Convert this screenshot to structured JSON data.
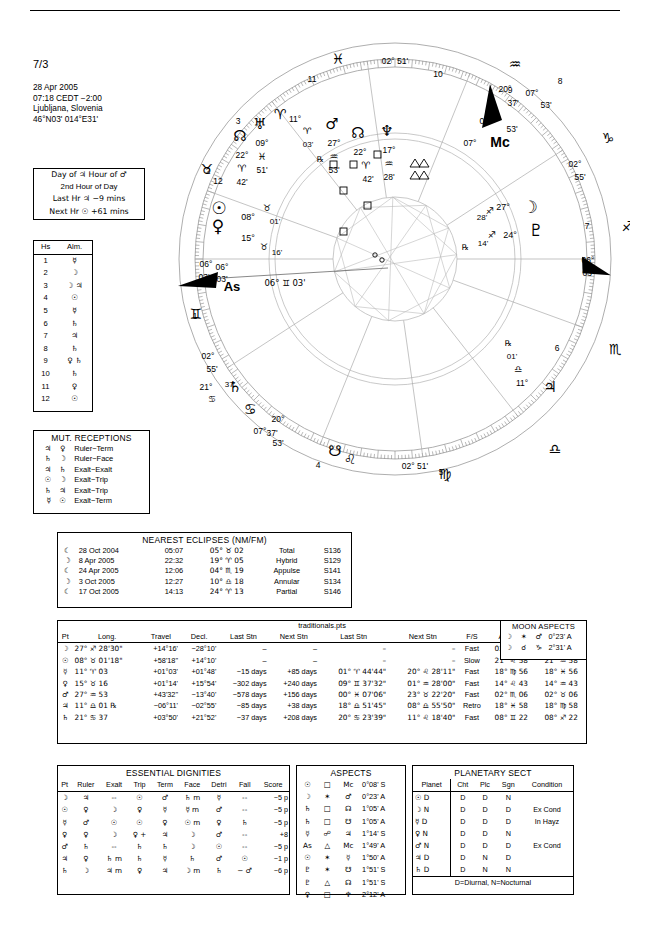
{
  "header": {
    "chart_number": "7/3",
    "date": "28 Apr 2005",
    "time": "07:18  CEDT −2:00",
    "place": "Ljubljana, Slovenia",
    "coords": "46°N03' 014°E31'"
  },
  "day_hour": {
    "line1": "Day of ♃  Hour of ♂",
    "line2": "2nd Hour of Day",
    "line3": "Last Hr ♃  −9 mins",
    "line4": "Next Hr ☉ +61 mins"
  },
  "almuten": {
    "col_house": "Hs",
    "col_alm": "Alm.",
    "rows": [
      {
        "house": "1",
        "alm": "☿"
      },
      {
        "house": "2",
        "alm": "☽"
      },
      {
        "house": "3",
        "alm": "☽ ♃"
      },
      {
        "house": "4",
        "alm": "☉"
      },
      {
        "house": "5",
        "alm": "☿"
      },
      {
        "house": "6",
        "alm": "♄"
      },
      {
        "house": "7",
        "alm": "♃"
      },
      {
        "house": "8",
        "alm": "♄"
      },
      {
        "house": "9",
        "alm": "♀ ♄"
      },
      {
        "house": "10",
        "alm": "♄"
      },
      {
        "house": "11",
        "alm": "♀"
      },
      {
        "house": "12",
        "alm": "☉"
      }
    ]
  },
  "mutual_receptions": {
    "title": "MUT. RECEPTIONS",
    "rows": [
      {
        "a": "♃",
        "b": "♀",
        "kind": "Ruler−Term"
      },
      {
        "a": "♄",
        "b": "☽",
        "kind": "Ruler−Face"
      },
      {
        "a": "♃",
        "b": "♄",
        "kind": "Exalt−Exalt"
      },
      {
        "a": "☉",
        "b": "☽",
        "kind": "Exalt−Trip"
      },
      {
        "a": "♄",
        "b": "♃",
        "kind": "Exalt−Trip"
      },
      {
        "a": "☿",
        "b": "☉",
        "kind": "Exalt−Term"
      }
    ]
  },
  "eclipses": {
    "title": "NEAREST ECLIPSES (NM/FM)",
    "rows": [
      {
        "phase": "☾",
        "date": "28 Oct 2004",
        "time": "05:07",
        "pos": "05° ♉ 02",
        "type": "Total",
        "saros": "S136"
      },
      {
        "phase": "☽",
        "date": "8 Apr 2005",
        "time": "22:32",
        "pos": "19° ♈ 05",
        "type": "Hybrid",
        "saros": "S129"
      },
      {
        "phase": "☾",
        "date": "24 Apr 2005",
        "time": "12:06",
        "pos": "04° ♏ 19",
        "type": "Appulse",
        "saros": "S141"
      },
      {
        "phase": "☽",
        "date": "3 Oct 2005",
        "time": "12:27",
        "pos": "10° ♎ 18",
        "type": "Annular",
        "saros": "S134"
      },
      {
        "phase": "☾",
        "date": "17 Oct 2005",
        "time": "14:13",
        "pos": "24° ♈ 13",
        "type": "Partial",
        "saros": "S146"
      }
    ]
  },
  "main_table": {
    "file_label": "traditionals.pts",
    "columns": [
      "Pt",
      "Long.",
      "Travel",
      "Decl.",
      "Last Stn",
      "Next Stn",
      "Last Stn",
      "Next Stn",
      "F/S",
      "Antiscia",
      "C.Ant."
    ],
    "rows": [
      {
        "pt": "☽",
        "long": "27° ♐ 28'30\"",
        "travel": "+14°16'",
        "decl": "−28°10'",
        "last_stn_d": "–",
        "next_stn_d": "–",
        "last_stn_p": "–",
        "next_stn_p": "–",
        "fs": "Fast",
        "antiscia": "02° ♑ 31",
        "cant": "02° ♋ 31"
      },
      {
        "pt": "☉",
        "long": "08° ♉ 01'18\"",
        "travel": "+58'18\"",
        "decl": "+14°10'",
        "last_stn_d": "–",
        "next_stn_d": "–",
        "last_stn_p": "–",
        "next_stn_p": "–",
        "fs": "Slow",
        "antiscia": "21° ♌ 58",
        "cant": "21° ♒ 58"
      },
      {
        "pt": "☿",
        "long": "11° ♈ 03",
        "travel": "+01°03'",
        "decl": "+01°48'",
        "last_stn_d": "−15 days",
        "next_stn_d": "+85 days",
        "last_stn_p": "01° ♈ 44'44\"",
        "next_stn_p": "20° ♌ 28'11\"",
        "fs": "Fast",
        "antiscia": "18° ♍ 56",
        "cant": "18° ♓ 56"
      },
      {
        "pt": "♀",
        "long": "15° ♉ 16",
        "travel": "+01°14'",
        "decl": "+15°54'",
        "last_stn_d": "−302 days",
        "next_stn_d": "+240 days",
        "last_stn_p": "09° ♊ 37'32\"",
        "next_stn_p": "01° ♒ 28'00\"",
        "fs": "Fast",
        "antiscia": "14° ♌ 43",
        "cant": "14° ♒ 43"
      },
      {
        "pt": "♂",
        "long": "27° ♒ 53",
        "travel": "+43'32\"",
        "decl": "−13°40'",
        "last_stn_d": "−578 days",
        "next_stn_d": "+156 days",
        "last_stn_p": "00° ♓ 07'06\"",
        "next_stn_p": "23° ♉ 22'20\"",
        "fs": "Fast",
        "antiscia": "02° ♏ 06",
        "cant": "02° ♉ 06"
      },
      {
        "pt": "♃",
        "long": "11° ♎ 01 ℞",
        "travel": "−06°11'",
        "decl": "−02°55'",
        "last_stn_d": "−85 days",
        "next_stn_d": "+38 days",
        "last_stn_p": "18° ♎ 51'45\"",
        "next_stn_p": "08° ♎ 55'50\"",
        "fs": "Retro",
        "antiscia": "18° ♓ 58",
        "cant": "18° ♍ 58"
      },
      {
        "pt": "♄",
        "long": "21° ♋ 37",
        "travel": "+03°50'",
        "decl": "+21°52'",
        "last_stn_d": "−37 days",
        "next_stn_d": "+208 days",
        "last_stn_p": "20° ♋ 23'39\"",
        "next_stn_p": "11° ♌ 18'40\"",
        "fs": "Fast",
        "antiscia": "08° ♊ 22",
        "cant": "08° ♐ 22"
      }
    ]
  },
  "moon_aspects": {
    "title": "MOON ASPECTS",
    "rows": [
      {
        "a": "☽",
        "asp": "✶",
        "b": "♂",
        "orb": "0°23' A"
      },
      {
        "a": "☽",
        "asp": "☌",
        "b": "♑",
        "orb": "2°31' A"
      }
    ]
  },
  "dignities": {
    "title": "ESSENTIAL DIGNITIES",
    "columns": [
      "Pt",
      "Ruler",
      "Exalt",
      "Trip",
      "Term",
      "Face",
      "Detri",
      "Fall",
      "Score"
    ],
    "rows": [
      {
        "pt": "☽",
        "ruler": "♃",
        "exalt": "--",
        "exalt_m": "",
        "trip": "☉",
        "trip_p": "",
        "term": "♂",
        "face": "♄",
        "face_m": "m",
        "detri": "☿",
        "fall": "--",
        "fall_d": "",
        "score": "−5 p"
      },
      {
        "pt": "☉",
        "ruler": "♀",
        "exalt": "☽",
        "exalt_m": "",
        "trip": "♀",
        "trip_p": "",
        "term": "☿",
        "face": "☿",
        "face_m": "m",
        "detri": "♂",
        "fall": "--",
        "fall_d": "",
        "score": "−5 p"
      },
      {
        "pt": "☿",
        "ruler": "♂",
        "exalt": "☉",
        "exalt_m": "",
        "trip": "☉",
        "trip_p": "",
        "term": "♀",
        "face": "☉",
        "face_m": "m",
        "detri": "♀",
        "fall": "♄",
        "fall_d": "",
        "score": "−5 p"
      },
      {
        "pt": "♀",
        "ruler": "♀",
        "exalt": "☽",
        "exalt_m": "",
        "trip": "♀",
        "trip_p": "+",
        "term": "♃",
        "face": "☽",
        "face_m": "",
        "detri": "♂",
        "fall": "--",
        "fall_d": "",
        "score": "+8"
      },
      {
        "pt": "♂",
        "ruler": "♄",
        "exalt": "--",
        "exalt_m": "",
        "trip": "♄",
        "trip_p": "",
        "term": "♄",
        "face": "☽",
        "face_m": "",
        "detri": "☉",
        "fall": "--",
        "fall_d": "",
        "score": "−5 p"
      },
      {
        "pt": "♃",
        "ruler": "♀",
        "exalt": "♄",
        "exalt_m": "m",
        "trip": "♄",
        "trip_p": "",
        "term": "☿",
        "face": "♄",
        "face_m": "",
        "detri": "♂",
        "fall": "☉",
        "fall_d": "",
        "score": "−1 p"
      },
      {
        "pt": "♄",
        "ruler": "☽",
        "exalt": "♃",
        "exalt_m": "m",
        "trip": "♀",
        "trip_p": "",
        "term": "♃",
        "face": "☽",
        "face_m": "m",
        "detri": "♄",
        "fall": "♂",
        "fall_d": "−",
        "score": "−6 p"
      }
    ],
    "ruler_plus_row": 3
  },
  "aspects": {
    "title": "ASPECTS",
    "rows": [
      {
        "a": "☉",
        "asp": "□",
        "b": "Mc",
        "orb": "0°08' S"
      },
      {
        "a": "☽",
        "asp": "✶",
        "b": "♂",
        "orb": "0°23' A"
      },
      {
        "a": "♄",
        "asp": "□",
        "b": "☊",
        "orb": "1°05' A"
      },
      {
        "a": "♄",
        "asp": "□",
        "b": "☋",
        "orb": "1°05' A"
      },
      {
        "a": "☿",
        "asp": "☍",
        "b": "♃",
        "orb": "1°14' S"
      },
      {
        "a": "As",
        "asp": "△",
        "b": "Mc",
        "orb": "1°49' A"
      },
      {
        "a": "☉",
        "asp": "✶",
        "b": "☿",
        "orb": "1°50' A"
      },
      {
        "a": "♇",
        "asp": "✶",
        "b": "☋",
        "orb": "1°51' S"
      },
      {
        "a": "♇",
        "asp": "△",
        "b": "☊",
        "orb": "1°51' S"
      },
      {
        "a": "♀",
        "asp": "□",
        "b": "♆",
        "orb": "2°12' A"
      }
    ]
  },
  "planetary_sect": {
    "title": "PLANETARY SECT",
    "columns": [
      "Planet",
      "Cht",
      "Plc",
      "Sgn",
      "Condition"
    ],
    "rows": [
      {
        "planet": "☉",
        "pd": "D",
        "cht": "D",
        "plc": "D",
        "sgn": "N",
        "condition": ""
      },
      {
        "planet": "☽",
        "pd": "N",
        "cht": "D",
        "plc": "D",
        "sgn": "D",
        "condition": "Ex Cond"
      },
      {
        "planet": "☿",
        "pd": "D",
        "cht": "D",
        "plc": "D",
        "sgn": "D",
        "condition": "In Hayz"
      },
      {
        "planet": "♀",
        "pd": "N",
        "cht": "D",
        "plc": "D",
        "sgn": "N",
        "condition": ""
      },
      {
        "planet": "♂",
        "pd": "N",
        "cht": "D",
        "plc": "D",
        "sgn": "D",
        "condition": "Ex Cond"
      },
      {
        "planet": "♃",
        "pd": "D",
        "cht": "D",
        "plc": "N",
        "sgn": "D",
        "condition": ""
      },
      {
        "planet": "♄",
        "pd": "D",
        "cht": "D",
        "plc": "N",
        "sgn": "N",
        "condition": ""
      }
    ],
    "footnote": "D=Diurnal, N=Nocturnal"
  },
  "wheel": {
    "ascendant_label": "As",
    "ascendant_text": "06° ♊ 03'",
    "mc_label": "Mc",
    "cusps": [
      {
        "num": "1",
        "deg": "06°",
        "min": "03'",
        "sign": "♊"
      },
      {
        "num": "2",
        "deg": "02°",
        "min": "55'",
        "sign": "♋"
      },
      {
        "num": "3",
        "deg": "07°",
        "min": "53'",
        "sign": "♌"
      },
      {
        "num": "4",
        "deg": "02°",
        "min": "51'",
        "sign": "♍"
      },
      {
        "num": "5",
        "deg": "",
        "min": "",
        "sign": "♎"
      },
      {
        "num": "6",
        "deg": "",
        "min": "",
        "sign": "♏"
      },
      {
        "num": "7",
        "deg": "06°",
        "min": "03'",
        "sign": "♐"
      },
      {
        "num": "8",
        "deg": "02°",
        "min": "55'",
        "sign": "♑"
      },
      {
        "num": "9",
        "deg": "07°",
        "min": "53'",
        "sign": "♒"
      },
      {
        "num": "10",
        "deg": "02°",
        "min": "51'",
        "sign": "♓"
      },
      {
        "num": "11",
        "deg": "",
        "min": "",
        "sign": "♈"
      },
      {
        "num": "12",
        "deg": "",
        "min": "",
        "sign": "♉"
      }
    ],
    "planets": [
      {
        "sym": "♅",
        "deg": "09°",
        "sign": "♓",
        "min": "51'"
      },
      {
        "sym": "♂",
        "deg": "27°",
        "sign": "♒",
        "min": "53'"
      },
      {
        "sym": "♆",
        "deg": "17°",
        "sign": "♒",
        "min": "28'"
      },
      {
        "sym": "☉",
        "deg": "08°",
        "sign": "♉",
        "min": "01'"
      },
      {
        "sym": "♀",
        "deg": "15°",
        "sign": "♉",
        "min": "16'"
      },
      {
        "sym": "☊",
        "deg": "22°",
        "sign": "♈",
        "min": "42'"
      },
      {
        "sym": "☽",
        "deg": "27°",
        "sign": "♐",
        "min": "28'"
      },
      {
        "sym": "♇",
        "deg": "24°",
        "sign": "♐",
        "min": "14'"
      },
      {
        "sym": "♄",
        "deg": "21°",
        "sign": "♋",
        "min": "37'"
      },
      {
        "sym": "♃",
        "deg": "11°",
        "sign": "♎",
        "min": "01'"
      },
      {
        "sym": "☿",
        "deg": "11°",
        "sign": "♈",
        "min": "03'"
      }
    ]
  }
}
